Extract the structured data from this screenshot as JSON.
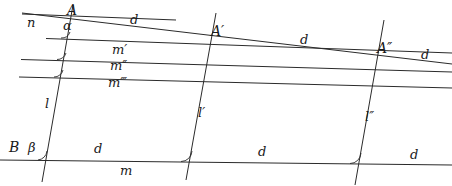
{
  "figure": {
    "width": 452,
    "height": 186,
    "background": "#ffffff",
    "stroke_color": "#2b2b2b",
    "label_color": "#1a1a1a"
  },
  "labels": {
    "n": "n",
    "A": "A",
    "alpha": "α",
    "A_prime": "A′",
    "A_double_prime": "A″",
    "d_top_left": "d",
    "d_top_mid": "d",
    "d_top_right": "d",
    "m_prime": "m′",
    "m_double_prime": "m″",
    "m_triple_prime": "m‴",
    "l": "l",
    "l_prime": "l′",
    "l_double_prime": "l″",
    "B": "B",
    "beta": "β",
    "d_bottom_left": "d",
    "d_bottom_mid": "d",
    "d_bottom_right": "d",
    "m": "m"
  },
  "geometry": {
    "horizontal_lines": [
      {
        "name": "n",
        "x1": 22,
        "y1": 14,
        "x2": 175,
        "y2": 20
      },
      {
        "name": "m-prime",
        "x1": 46,
        "y1": 38,
        "x2": 452,
        "y2": 53
      },
      {
        "name": "m-double-prime",
        "x1": 22,
        "y1": 60,
        "x2": 452,
        "y2": 72
      },
      {
        "name": "m-triple-prime",
        "x1": 20,
        "y1": 77,
        "x2": 452,
        "y2": 88
      },
      {
        "name": "m",
        "x1": 0,
        "y1": 160,
        "x2": 452,
        "y2": 165
      }
    ],
    "transversal_d": {
      "x1": 22,
      "y1": 13,
      "x2": 452,
      "y2": 64
    },
    "transversals": [
      {
        "name": "l",
        "x1": 73,
        "y1": 5,
        "x2": 42,
        "y2": 182
      },
      {
        "name": "l-prime",
        "x1": 216,
        "y1": 13,
        "x2": 186,
        "y2": 180
      },
      {
        "name": "l-double-prime",
        "x1": 384,
        "y1": 20,
        "x2": 355,
        "y2": 185
      }
    ],
    "angle_marks": [
      {
        "name": "alpha-at-A",
        "cx": 67,
        "cy": 36
      },
      {
        "name": "angle-at-m-double-prime-left",
        "cx": 62,
        "cy": 59
      },
      {
        "name": "angle-at-m-triple-prime-left",
        "cx": 59,
        "cy": 76
      },
      {
        "name": "beta-at-B",
        "cx": 47,
        "cy": 160
      },
      {
        "name": "angle-at-l-prime-bottom",
        "cx": 188,
        "cy": 162
      },
      {
        "name": "angle-at-l-double-prime-bottom",
        "cx": 357,
        "cy": 164
      }
    ],
    "points": [
      {
        "name": "A",
        "x": 67,
        "y": 24
      },
      {
        "name": "A-prime",
        "x": 206,
        "y": 40
      },
      {
        "name": "A-double-prime",
        "x": 372,
        "y": 58
      },
      {
        "name": "B",
        "x": 49,
        "y": 160
      }
    ]
  }
}
